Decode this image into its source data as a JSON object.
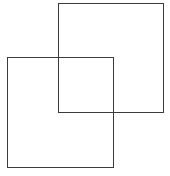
{
  "figure": {
    "canvas": {
      "width": 170,
      "height": 176,
      "background_color": "#ffffff"
    },
    "style": {
      "stroke_color": "#3b3b3b",
      "stroke_width": 1,
      "fill": "none"
    },
    "shapes": [
      {
        "name": "upper-right-square",
        "type": "square",
        "x": 58,
        "y": 3,
        "width": 106,
        "height": 110,
        "corners": [
          [
            58,
            3
          ],
          [
            164,
            3
          ],
          [
            164,
            113
          ],
          [
            58,
            113
          ]
        ],
        "stroke_color": "#3b3b3b",
        "fill": "none"
      },
      {
        "name": "lower-left-square",
        "type": "square",
        "x": 7,
        "y": 57,
        "width": 107,
        "height": 111,
        "corners": [
          [
            7,
            57
          ],
          [
            114,
            57
          ],
          [
            114,
            168
          ],
          [
            7,
            168
          ]
        ],
        "stroke_color": "#3b3b3b",
        "fill": "none"
      }
    ],
    "overlap_region": {
      "name": "intersection-rectangle",
      "x": 58,
      "y": 57,
      "width": 56,
      "height": 56,
      "fill": "none"
    },
    "labels": []
  }
}
